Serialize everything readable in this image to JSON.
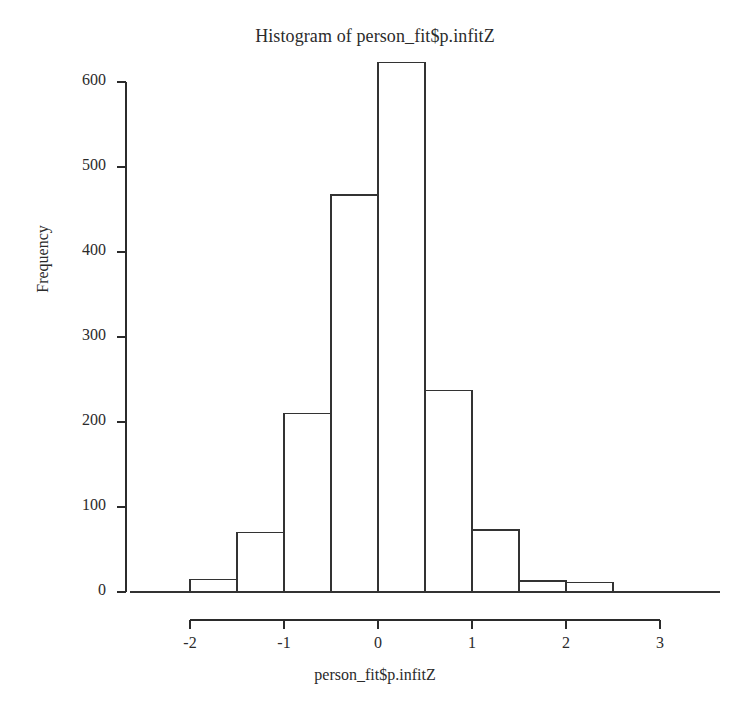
{
  "chart_data": {
    "type": "bar",
    "title": "Histogram of person_fit$p.infitZ",
    "xlabel": "person_fit$p.infitZ",
    "ylabel": "Frequency",
    "grid": false,
    "legend": null,
    "xlim": [
      -2.3,
      3.1
    ],
    "ylim": [
      0,
      640
    ],
    "bin_width": 0.5,
    "bin_edges": [
      -2.0,
      -1.5,
      -1.0,
      -0.5,
      0.0,
      0.5,
      1.0,
      1.5,
      2.0,
      2.5
    ],
    "categories": [
      "-2.0 to -1.5",
      "-1.5 to -1.0",
      "-1.0 to -0.5",
      "-0.5 to 0.0",
      "0.0 to 0.5",
      "0.5 to 1.0",
      "1.0 to 1.5",
      "1.5 to 2.0",
      "2.0 to 2.5"
    ],
    "values": [
      15,
      70,
      210,
      467,
      623,
      237,
      73,
      13,
      11
    ],
    "xticks": [
      -2,
      -1,
      0,
      1,
      2,
      3
    ],
    "xtick_labels": [
      "-2",
      "-1",
      "0",
      "1",
      "2",
      "3"
    ],
    "yticks": [
      0,
      100,
      200,
      300,
      400,
      500,
      600
    ],
    "ytick_labels": [
      "0",
      "100",
      "200",
      "300",
      "400",
      "500",
      "600"
    ],
    "bar_fill": "#ffffff",
    "bar_stroke": "#333333",
    "axis_color": "#2b2b2b",
    "background": "#ffffff"
  }
}
